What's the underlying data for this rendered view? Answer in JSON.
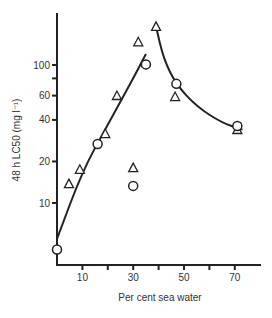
{
  "chart_data": {
    "type": "scatter",
    "title": "",
    "xlabel": "Per cent sea water",
    "ylabel": "48 h LC50 (mg l⁻¹)",
    "x_ticks": [
      10,
      20,
      30,
      40,
      50,
      60,
      70
    ],
    "x_tick_labels": [
      "10",
      "30",
      "50",
      "70"
    ],
    "xlim": [
      0,
      80
    ],
    "y_scale": "log",
    "y_ticks": [
      10,
      20,
      40,
      60,
      80,
      100
    ],
    "y_tick_labels": [
      "10",
      "20",
      "40",
      "60",
      "100"
    ],
    "ylim": [
      3,
      250
    ],
    "grid": false,
    "legend": "none",
    "series": [
      {
        "name": "triangles",
        "marker": "triangle",
        "points": [
          {
            "x": 4.7,
            "y": 13.7
          },
          {
            "x": 9,
            "y": 17.4
          },
          {
            "x": 19,
            "y": 31.6
          },
          {
            "x": 23.6,
            "y": 59.6
          },
          {
            "x": 32,
            "y": 146
          },
          {
            "x": 39,
            "y": 189
          },
          {
            "x": 46.5,
            "y": 58.6
          },
          {
            "x": 71,
            "y": 33.8
          },
          {
            "x": 30,
            "y": 17.9
          }
        ]
      },
      {
        "name": "circles",
        "marker": "circle",
        "points": [
          {
            "x": 0,
            "y": 4.6
          },
          {
            "x": 16,
            "y": 26.8
          },
          {
            "x": 35,
            "y": 101
          },
          {
            "x": 47,
            "y": 73
          },
          {
            "x": 71,
            "y": 36.1
          },
          {
            "x": 30,
            "y": 13.3
          }
        ]
      }
    ],
    "fitted_curves": [
      {
        "name": "rising-fit",
        "points": [
          {
            "x": 0,
            "y": 5.5
          },
          {
            "x": 10,
            "y": 17
          },
          {
            "x": 20,
            "y": 37
          },
          {
            "x": 30,
            "y": 80
          },
          {
            "x": 35,
            "y": 120
          }
        ]
      },
      {
        "name": "falling-fit",
        "points": [
          {
            "x": 39,
            "y": 189
          },
          {
            "x": 42,
            "y": 110
          },
          {
            "x": 47,
            "y": 72
          },
          {
            "x": 55,
            "y": 50
          },
          {
            "x": 65,
            "y": 38
          },
          {
            "x": 73,
            "y": 34
          }
        ]
      }
    ]
  }
}
